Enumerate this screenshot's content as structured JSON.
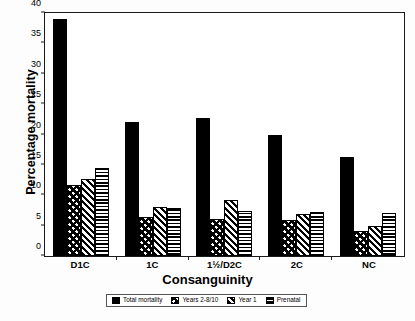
{
  "chart_data": {
    "type": "bar",
    "title": "",
    "xlabel": "Consanguinity",
    "ylabel": "Percentage mortality",
    "ylim": [
      0,
      40
    ],
    "ytick_step": 5,
    "yticks": [
      0,
      5,
      10,
      15,
      20,
      25,
      30,
      35,
      40
    ],
    "grid": false,
    "legend_position": "bottom",
    "categories": [
      "D1C",
      "1C",
      "1½/D2C",
      "2C",
      "NC"
    ],
    "series": [
      {
        "name": "Total mortality",
        "pattern": "solid-black",
        "values": [
          39.0,
          22.0,
          22.8,
          20.0,
          16.3
        ]
      },
      {
        "name": "Years 2-8/10",
        "pattern": "chevron",
        "values": [
          11.7,
          6.5,
          6.1,
          5.9,
          4.2
        ]
      },
      {
        "name": "Year 1",
        "pattern": "diagonal",
        "values": [
          12.7,
          8.0,
          9.2,
          6.9,
          5.0
        ]
      },
      {
        "name": "Prenatal",
        "pattern": "horizontal",
        "values": [
          14.5,
          7.9,
          7.4,
          7.2,
          7.0
        ]
      }
    ]
  },
  "colors": {
    "axis": "#1a1a1a",
    "bar_fill": "#000000",
    "background": "#ffffff"
  }
}
